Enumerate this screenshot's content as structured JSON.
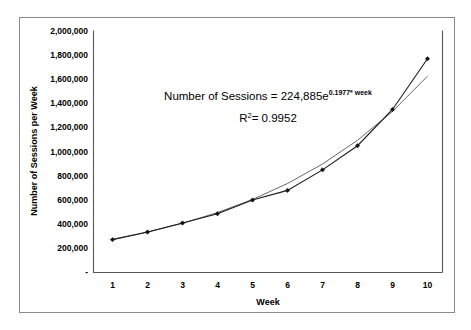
{
  "chart_data": {
    "type": "line",
    "title": "",
    "xlabel": "Week",
    "ylabel": "Number of Sessions per Week",
    "x": [
      1,
      2,
      3,
      4,
      5,
      6,
      7,
      8,
      9,
      10
    ],
    "categories": [
      "1",
      "2",
      "3",
      "4",
      "5",
      "6",
      "7",
      "8",
      "9",
      "10"
    ],
    "series": [
      {
        "name": "Number of Sessions",
        "values": [
          272000,
          335000,
          410000,
          487000,
          600000,
          680000,
          850000,
          1050000,
          1350000,
          1770000
        ]
      },
      {
        "name": "Exponential trendline",
        "values": [
          274100,
          334100,
          407200,
          496200,
          604800,
          737100,
          898300,
          1094700,
          1334100,
          1625900
        ]
      }
    ],
    "ylim": [
      0,
      2000000
    ],
    "xlim": [
      0.5,
      10.5
    ],
    "ytick_labels": [
      "-",
      "200,000",
      "400,000",
      "600,000",
      "800,000",
      "1,000,000",
      "1,200,000",
      "1,400,000",
      "1,600,000",
      "1,800,000",
      "2,000,000"
    ],
    "ytick_values": [
      0,
      200000,
      400000,
      600000,
      800000,
      1000000,
      1200000,
      1400000,
      1600000,
      1800000,
      2000000
    ],
    "xtick_labels": [
      "1",
      "2",
      "3",
      "4",
      "5",
      "6",
      "7",
      "8",
      "9",
      "10"
    ],
    "grid": false,
    "legend": "none",
    "annotations": {
      "equation_prefix": "Number of Sessions = 224,885e",
      "equation_exponent": "0.1977* week",
      "r_squared_label": "R",
      "r_squared_exponent": "2",
      "r_squared_value": "= 0.9952"
    },
    "colors": {
      "series_line": "#1a1a1a",
      "trend_line": "#555555",
      "marker": "#111111",
      "axis": "#595959",
      "frame": "#8a8a8a",
      "background": "#ffffff"
    }
  }
}
